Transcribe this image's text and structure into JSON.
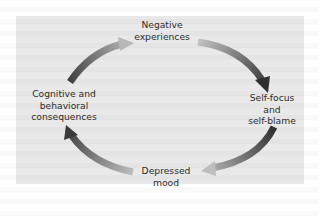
{
  "diagram": {
    "type": "cycle",
    "nodes": [
      {
        "id": "negative-experiences",
        "lines": [
          "Negative",
          "experiences"
        ]
      },
      {
        "id": "self-focus",
        "lines": [
          "Self-focus",
          "and",
          "self-blame"
        ]
      },
      {
        "id": "depressed-mood",
        "lines": [
          "Depressed",
          "mood"
        ]
      },
      {
        "id": "cognitive-consequences",
        "lines": [
          "Cognitive and",
          "behavioral",
          "consequences"
        ]
      }
    ],
    "edges": [
      {
        "from": "cognitive-consequences",
        "to": "negative-experiences"
      },
      {
        "from": "negative-experiences",
        "to": "self-focus"
      },
      {
        "from": "self-focus",
        "to": "depressed-mood"
      },
      {
        "from": "depressed-mood",
        "to": "cognitive-consequences"
      }
    ],
    "colors": {
      "panel": "#e9e9e9",
      "text": "#2b2b2b",
      "arrow_dark": "#3a3a3a",
      "arrow_light": "#b8b8b8"
    }
  }
}
